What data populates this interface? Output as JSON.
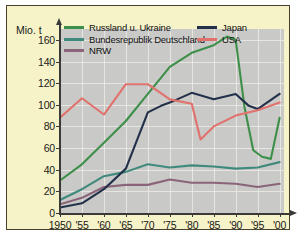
{
  "chart_data": {
    "type": "line",
    "title": "",
    "subtitle": "",
    "xlabel": "",
    "ylabel": "Mio. t",
    "ylim": [
      0,
      170
    ],
    "xlim": [
      1950,
      2001
    ],
    "grid": true,
    "legend_position": "top-inside",
    "y_ticks": [
      0,
      20,
      40,
      60,
      80,
      100,
      120,
      140,
      160
    ],
    "y_tick_labels": [
      "0",
      "20",
      "40",
      "60",
      "80",
      "100",
      "120",
      "140",
      "160"
    ],
    "x_ticks": [
      1950,
      1955,
      1960,
      1965,
      1970,
      1975,
      1980,
      1985,
      1990,
      1995,
      2000
    ],
    "x_tick_labels": [
      "1950",
      "'55",
      "'60",
      "'65",
      "'70",
      "'75",
      "'80",
      "'85",
      "'90",
      "'95",
      "'00"
    ],
    "series": [
      {
        "name": "Russland u. Ukraine",
        "color": "#3d8f49",
        "x": [
          1950,
          1955,
          1960,
          1965,
          1970,
          1975,
          1980,
          1985,
          1988,
          1990,
          1992,
          1994,
          1996,
          1998,
          2000
        ],
        "values": [
          30,
          45,
          65,
          85,
          110,
          135,
          148,
          155,
          163,
          160,
          98,
          58,
          52,
          50,
          88
        ]
      },
      {
        "name": "Bundesrepublik Deutschland",
        "color": "#3f8a7c",
        "x": [
          1950,
          1955,
          1960,
          1965,
          1970,
          1975,
          1980,
          1985,
          1990,
          1995,
          2000
        ],
        "values": [
          12,
          22,
          34,
          38,
          45,
          42,
          44,
          43,
          41,
          42,
          47
        ]
      },
      {
        "name": "NRW",
        "color": "#8a6478",
        "x": [
          1950,
          1955,
          1960,
          1965,
          1970,
          1975,
          1980,
          1985,
          1990,
          1995,
          2000
        ],
        "values": [
          8,
          14,
          24,
          26,
          26,
          31,
          28,
          28,
          27,
          24,
          27
        ]
      },
      {
        "name": "Japan",
        "color": "#22304a",
        "x": [
          1950,
          1955,
          1960,
          1965,
          1970,
          1973,
          1975,
          1980,
          1985,
          1990,
          1993,
          1995,
          2000
        ],
        "values": [
          5,
          9,
          22,
          41,
          93,
          99,
          102,
          111,
          105,
          110,
          99,
          96,
          110
        ]
      },
      {
        "name": "USA",
        "color": "#e0716c",
        "x": [
          1950,
          1955,
          1960,
          1965,
          1970,
          1975,
          1980,
          1982,
          1985,
          1990,
          1995,
          2000
        ],
        "values": [
          88,
          106,
          91,
          119,
          119,
          105,
          101,
          68,
          80,
          90,
          95,
          102
        ]
      }
    ]
  },
  "axes": {
    "units_label": "Mio. t"
  },
  "legend": {
    "left_column": [
      {
        "label": "Russland u. Ukraine",
        "color": "#3d8f49"
      },
      {
        "label": "Bundesrepublik Deutschland",
        "color": "#3f8a7c"
      },
      {
        "label": "NRW",
        "color": "#8a6478"
      }
    ],
    "right_column": [
      {
        "label": "Japan",
        "color": "#22304a"
      },
      {
        "label": "USA",
        "color": "#e0716c"
      }
    ]
  },
  "style": {
    "card_background": "#f7f3c8",
    "panel_background": "#c9c9c7",
    "grid_color": "#eceae4",
    "axis_color": "#3a3a3a",
    "text_color": "#1a1a1a"
  }
}
